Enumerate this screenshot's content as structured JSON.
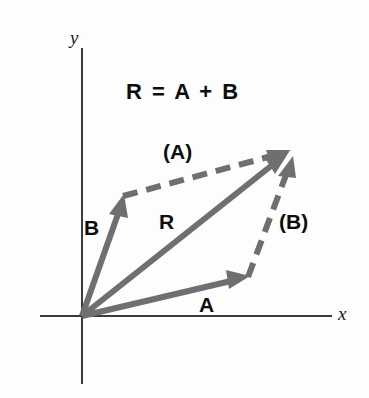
{
  "figure": {
    "background_color": "#fdfdfd",
    "vector_color": "#6f6f6f",
    "axis_color": "#3a3a3a",
    "text_color": "#0d0d0d",
    "width": 369,
    "height": 398
  },
  "axes": {
    "x_label": "x",
    "y_label": "y",
    "origin": {
      "x": 82,
      "y": 316
    },
    "x_axis": {
      "x1": 40,
      "y1": 316,
      "x2": 332,
      "y2": 316
    },
    "y_axis": {
      "x1": 82,
      "y1": 48,
      "x2": 82,
      "y2": 384
    }
  },
  "equation": {
    "text": "R  =  A  +  B"
  },
  "vectors": [
    {
      "name": "A",
      "label": "A",
      "style": "solid",
      "from": {
        "x": 82,
        "y": 316
      },
      "to": {
        "x": 248,
        "y": 277
      },
      "label_pos": {
        "x": 199,
        "y": 294
      }
    },
    {
      "name": "B",
      "label": "B",
      "style": "solid",
      "from": {
        "x": 82,
        "y": 316
      },
      "to": {
        "x": 123,
        "y": 196
      },
      "label_pos": {
        "x": 84,
        "y": 217
      }
    },
    {
      "name": "R",
      "label": "R",
      "style": "solid",
      "from": {
        "x": 82,
        "y": 316
      },
      "to": {
        "x": 288,
        "y": 152
      },
      "label_pos": {
        "x": 159,
        "y": 211
      }
    },
    {
      "name": "A-translated",
      "label": "(A)",
      "style": "dashed",
      "from": {
        "x": 123,
        "y": 196
      },
      "to": {
        "x": 290,
        "y": 151
      },
      "label_pos": {
        "x": 163,
        "y": 141
      }
    },
    {
      "name": "B-translated",
      "label": "(B)",
      "style": "dashed",
      "from": {
        "x": 248,
        "y": 277
      },
      "to": {
        "x": 292,
        "y": 158
      },
      "label_pos": {
        "x": 279,
        "y": 211
      }
    }
  ],
  "stroke": {
    "vector_width": 6,
    "dash_pattern": "15 9",
    "axis_width": 2,
    "arrowhead_length": 20,
    "arrowhead_half_width": 9
  }
}
